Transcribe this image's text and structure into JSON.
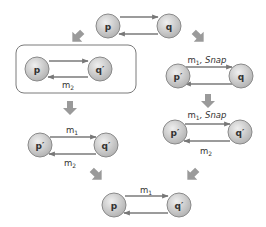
{
  "diagram": {
    "colors": {
      "node_fill_top": "#e8e8e8",
      "node_fill_bottom": "#b4b4b4",
      "node_stroke": "#8a8a8a",
      "edge": "#7a7a7a",
      "arrow": "#9a9a9a",
      "box_stroke": "#7a7a7a"
    },
    "top": {
      "left_node": "p",
      "right_node": "q"
    },
    "left_box": {
      "left_node": "p",
      "right_node": "q′",
      "bottom_label": "m",
      "bottom_label_sub": "2"
    },
    "right_1": {
      "left_node": "p′",
      "right_node": "q",
      "top_label": "m",
      "top_label_sub": "1",
      "top_label_suffix": ", Snap"
    },
    "left_2": {
      "left_node": "p′",
      "right_node": "q′",
      "top_label": "m",
      "top_label_sub": "1",
      "bottom_label": "m",
      "bottom_label_sub": "2"
    },
    "right_2": {
      "left_node": "p′",
      "right_node": "q′",
      "top_label": "m",
      "top_label_sub": "1",
      "top_label_suffix": ", Snap",
      "bottom_label": "m",
      "bottom_label_sub": "2"
    },
    "bottom": {
      "left_node": "p",
      "right_node": "q′",
      "top_label": "m",
      "top_label_sub": "1"
    }
  }
}
